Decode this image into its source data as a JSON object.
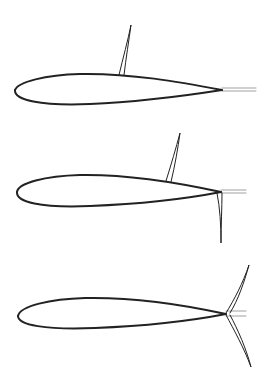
{
  "figure": {
    "stroke_color": "#222222",
    "thin_line_color": "#888888",
    "background": "#ffffff"
  },
  "airfoils": [
    {
      "id": "airfoil-1",
      "configuration": "upper-surface spoiler deployed",
      "leading_edge": [
        15,
        92
      ],
      "trailing_edge": [
        222,
        90
      ],
      "upper_path": "M222,90 C180,82 130,73 80,74 C45,75 18,82 15,90",
      "lower_path": "M15,90 C14,100 40,106 90,104 C140,102 190,95 222,90",
      "trailing_lines": [
        "M222,88 L256,88",
        "M222,91 L256,91"
      ],
      "elements": [
        {
          "name": "spoiler",
          "path": "M119,75 C123,58 128,40 131,25 C129,40 126,58 124,75"
        }
      ]
    },
    {
      "id": "airfoil-2",
      "configuration": "upper spoiler and lower split flap deployed",
      "leading_edge": [
        17,
        193
      ],
      "trailing_edge": [
        221,
        192
      ],
      "upper_path": "M221,192 C180,183 130,174 80,175 C45,176 18,183 17,192",
      "lower_path": "M17,192 C16,202 40,208 90,206 C140,204 190,198 221,192",
      "trailing_lines": [
        "M221,190 L246,190",
        "M221,193 L246,193"
      ],
      "elements": [
        {
          "name": "spoiler",
          "path": "M166,181 C171,165 176,148 180,133 C178,148 175,165 171,182"
        },
        {
          "name": "lower-flap",
          "path": "M217,193 C220,208 221,225 221,243 C221,225 222,208 222,193"
        }
      ]
    },
    {
      "id": "airfoil-3",
      "configuration": "split trailing-edge surfaces deflected up and down",
      "leading_edge": [
        18,
        316
      ],
      "trailing_edge": [
        226,
        314
      ],
      "upper_path": "M226,314 C185,305 135,297 85,298 C50,299 20,306 18,316",
      "lower_path": "M18,316 C18,325 45,330 95,328 C145,326 195,320 226,314",
      "trailing_lines": [
        "M226,311 L246,311",
        "M226,316 L246,316"
      ],
      "elements": [
        {
          "name": "upper-surface",
          "path": "M226,313 C234,300 243,283 249,265 C244,283 238,300 230,313"
        },
        {
          "name": "lower-surface",
          "path": "M226,315 C234,330 244,348 251,367 C246,348 238,330 230,315"
        }
      ]
    }
  ]
}
